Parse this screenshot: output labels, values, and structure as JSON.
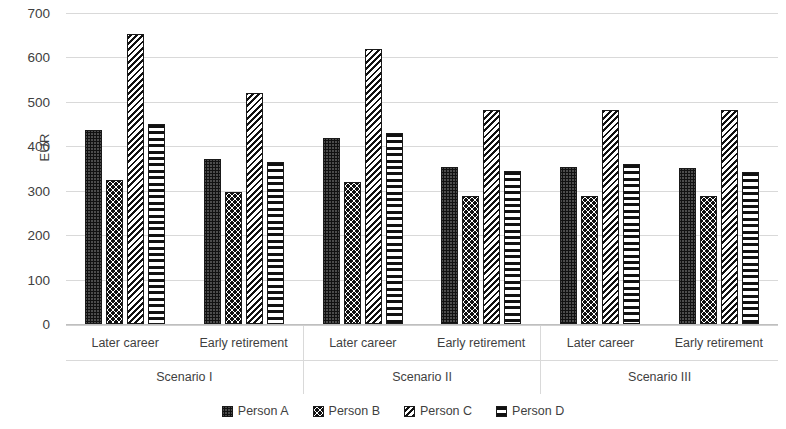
{
  "chart_data": {
    "type": "bar",
    "title": "",
    "xlabel": "",
    "ylabel": "EUR",
    "ylim": [
      0,
      700
    ],
    "ytick_step": 100,
    "yticks": [
      700,
      600,
      500,
      400,
      300,
      200,
      100,
      0
    ],
    "grid": true,
    "legend_position": "bottom",
    "groups": [
      {
        "name": "Scenario I",
        "categories": [
          {
            "label": "Later career",
            "values": [
              437,
              325,
              653,
              450
            ]
          },
          {
            "label": "Early retirement",
            "values": [
              371,
              297,
              519,
              364
            ]
          }
        ]
      },
      {
        "name": "Scenario II",
        "categories": [
          {
            "label": "Later career",
            "values": [
              419,
              320,
              618,
              429
            ]
          },
          {
            "label": "Early retirement",
            "values": [
              353,
              288,
              482,
              345
            ]
          }
        ]
      },
      {
        "name": "Scenario III",
        "categories": [
          {
            "label": "Later career",
            "values": [
              353,
              288,
              481,
              360
            ]
          },
          {
            "label": "Early retirement",
            "values": [
              352,
              288,
              481,
              343
            ]
          }
        ]
      }
    ],
    "series": [
      {
        "name": "Person A",
        "pattern": "dense-dots",
        "values": [
          437,
          371,
          419,
          353,
          353,
          352
        ]
      },
      {
        "name": "Person B",
        "pattern": "sparse-dots",
        "values": [
          325,
          297,
          320,
          288,
          288,
          288
        ]
      },
      {
        "name": "Person C",
        "pattern": "diagonal-hatch",
        "values": [
          653,
          519,
          618,
          482,
          481,
          481
        ]
      },
      {
        "name": "Person D",
        "pattern": "horizontal-lines",
        "values": [
          450,
          364,
          429,
          345,
          360,
          343
        ]
      }
    ],
    "legend": [
      {
        "label": "Person A",
        "pattern": "dense-dots"
      },
      {
        "label": "Person B",
        "pattern": "sparse-dots"
      },
      {
        "label": "Person C",
        "pattern": "diagonal-hatch"
      },
      {
        "label": "Person D",
        "pattern": "horizontal-lines"
      }
    ],
    "colors": {
      "bar_outline": "#1a1a1a",
      "bar_fill": "#111111",
      "gridline": "#d9d9d9",
      "text": "#3f3f3f",
      "background": "#ffffff"
    }
  }
}
